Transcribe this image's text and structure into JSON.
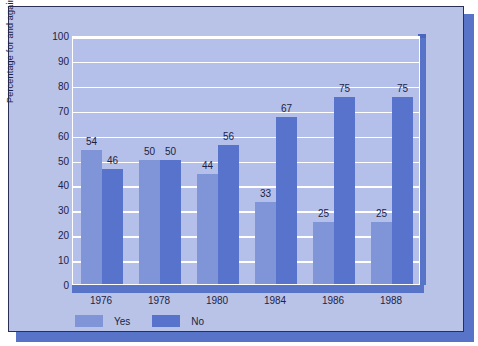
{
  "chart_data": {
    "type": "bar",
    "title": "",
    "xlabel": "",
    "ylabel": "Percentage for and against",
    "categories": [
      "1976",
      "1978",
      "1980",
      "1984",
      "1986",
      "1988"
    ],
    "series": [
      {
        "name": "Yes",
        "color": "#8094d8",
        "values": [
          54,
          50,
          44,
          33,
          25,
          25
        ]
      },
      {
        "name": "No",
        "color": "#5873cb",
        "values": [
          46,
          50,
          56,
          67,
          75,
          75
        ]
      }
    ],
    "ylim": [
      0,
      100
    ],
    "yticks": [
      0,
      10,
      20,
      30,
      40,
      50,
      60,
      70,
      80,
      90,
      100
    ],
    "ytick_labels": [
      "0",
      "10",
      "20",
      "30",
      "40",
      "50",
      "60",
      "70",
      "80",
      "90",
      "100"
    ],
    "grid": true,
    "grid_color": "#ffffff",
    "legend_position": "bottom-left",
    "plot_background": "#b4c0ea",
    "figure_background": "#b9c3e8",
    "shadow_color": "#5874c8",
    "border_color": "#2a2f55",
    "data_labels": true
  },
  "legend": {
    "items": [
      {
        "label": "Yes",
        "color": "#8094d8"
      },
      {
        "label": "No",
        "color": "#5873cb"
      }
    ]
  }
}
